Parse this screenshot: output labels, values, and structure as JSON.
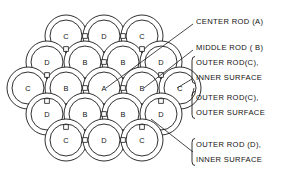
{
  "diagram": {
    "stroke_color": "#1a1a1a",
    "background_color": "#ffffff"
  },
  "rods": [
    {
      "id": "r1",
      "label": "C",
      "row": 1,
      "cx": 66,
      "cy": 36,
      "r_outer": 21,
      "r_inner": 16
    },
    {
      "id": "r2",
      "label": "D",
      "row": 1,
      "cx": 104,
      "cy": 36,
      "r_outer": 21,
      "r_inner": 16
    },
    {
      "id": "r3",
      "label": "C",
      "row": 1,
      "cx": 142,
      "cy": 36,
      "r_outer": 21,
      "r_inner": 16
    },
    {
      "id": "r4",
      "label": "D",
      "row": 2,
      "cx": 47,
      "cy": 62,
      "r_outer": 21,
      "r_inner": 16
    },
    {
      "id": "r5",
      "label": "B",
      "row": 2,
      "cx": 85,
      "cy": 62,
      "r_outer": 21,
      "r_inner": 16
    },
    {
      "id": "r6",
      "label": "B",
      "row": 2,
      "cx": 123,
      "cy": 62,
      "r_outer": 21,
      "r_inner": 16
    },
    {
      "id": "r7",
      "label": "D",
      "row": 2,
      "cx": 161,
      "cy": 62,
      "r_outer": 21,
      "r_inner": 16
    },
    {
      "id": "r8",
      "label": "C",
      "row": 3,
      "cx": 28,
      "cy": 88,
      "r_outer": 21,
      "r_inner": 16
    },
    {
      "id": "r9",
      "label": "B",
      "row": 3,
      "cx": 66,
      "cy": 88,
      "r_outer": 21,
      "r_inner": 16
    },
    {
      "id": "r10",
      "label": "A",
      "row": 3,
      "cx": 104,
      "cy": 88,
      "r_outer": 21,
      "r_inner": 16
    },
    {
      "id": "r11",
      "label": "B",
      "row": 3,
      "cx": 142,
      "cy": 88,
      "r_outer": 21,
      "r_inner": 16
    },
    {
      "id": "r12",
      "label": "C",
      "row": 3,
      "cx": 180,
      "cy": 88,
      "r_outer": 21,
      "r_inner": 16
    },
    {
      "id": "r13",
      "label": "D",
      "row": 4,
      "cx": 47,
      "cy": 114,
      "r_outer": 21,
      "r_inner": 16
    },
    {
      "id": "r14",
      "label": "B",
      "row": 4,
      "cx": 85,
      "cy": 114,
      "r_outer": 21,
      "r_inner": 16
    },
    {
      "id": "r15",
      "label": "B",
      "row": 4,
      "cx": 123,
      "cy": 114,
      "r_outer": 21,
      "r_inner": 16
    },
    {
      "id": "r16",
      "label": "D",
      "row": 4,
      "cx": 161,
      "cy": 114,
      "r_outer": 21,
      "r_inner": 16
    },
    {
      "id": "r17",
      "label": "C",
      "row": 5,
      "cx": 66,
      "cy": 140,
      "r_outer": 21,
      "r_inner": 16
    },
    {
      "id": "r18",
      "label": "D",
      "row": 5,
      "cx": 104,
      "cy": 140,
      "r_outer": 21,
      "r_inner": 16
    },
    {
      "id": "r19",
      "label": "C",
      "row": 5,
      "cx": 142,
      "cy": 140,
      "r_outer": 21,
      "r_inner": 16
    }
  ],
  "spacers": [
    {
      "cx": 85,
      "cy": 36
    },
    {
      "cx": 123,
      "cy": 36
    },
    {
      "cx": 66,
      "cy": 49
    },
    {
      "cx": 142,
      "cy": 49
    },
    {
      "cx": 47,
      "cy": 75
    },
    {
      "cx": 104,
      "cy": 62
    },
    {
      "cx": 161,
      "cy": 75
    },
    {
      "cx": 85,
      "cy": 88
    },
    {
      "cx": 123,
      "cy": 88
    },
    {
      "cx": 47,
      "cy": 101
    },
    {
      "cx": 161,
      "cy": 101
    },
    {
      "cx": 104,
      "cy": 114
    },
    {
      "cx": 66,
      "cy": 127
    },
    {
      "cx": 142,
      "cy": 127
    },
    {
      "cx": 85,
      "cy": 140
    },
    {
      "cx": 123,
      "cy": 140
    }
  ],
  "callouts": [
    {
      "id": "center-rod",
      "text": "CENTER ROD (A)",
      "lines": [
        "CENTER ROD (A)"
      ],
      "text_x": 196,
      "text_y": 21,
      "leader": "M193,24 L106,88",
      "bracket": false
    },
    {
      "id": "middle-rod",
      "text": "MIDDLE ROD (B)",
      "lines": [
        "MIDDLE  ROD ( B)"
      ],
      "text_x": 196,
      "text_y": 47,
      "leader": "M193,50 L144,88",
      "bracket": false
    },
    {
      "id": "outer-rod-c-inner-surface",
      "text": "OUTER ROD(C), INNER SURFACE",
      "lines": [
        "OUTER ROD(C),",
        "INNER  SURFACE"
      ],
      "text_x": 196,
      "text_y": 70,
      "leader": "M192,79 L177,88",
      "bracket": true
    },
    {
      "id": "outer-rod-c-outer-surface",
      "text": "OUTER ROD(C), OUTER SURFACE",
      "lines": [
        "OUTER  ROD(C),",
        "OUTER  SURFACE"
      ],
      "text_x": 196,
      "text_y": 105,
      "leader": "M192,96 L194,88",
      "bracket": true
    },
    {
      "id": "outer-rod-d-inner-surface",
      "text": "OUTER ROD (D), INNER SURFACE",
      "lines": [
        "OUTER  ROD (D),",
        "INNER  SURFACE"
      ],
      "text_x": 196,
      "text_y": 152,
      "leader": "M193,152 L151,119",
      "bracket": true
    }
  ]
}
